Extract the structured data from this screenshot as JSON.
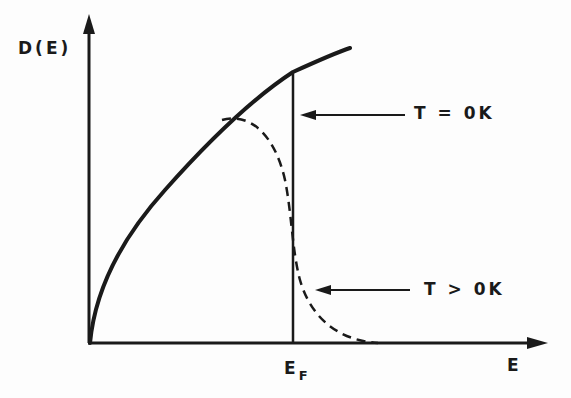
{
  "diagram": {
    "y_axis_label": "D(E)",
    "x_axis_label": "E",
    "fermi_label_main": "E",
    "fermi_label_sub": "F",
    "annotations": [
      {
        "id": "t-zero",
        "text": "T = 0K",
        "points_to": "vertical step at E_F (solid)"
      },
      {
        "id": "t-positive",
        "text": "T > 0K",
        "points_to": "dashed smeared tail"
      }
    ],
    "colors": {
      "ink": "#1a1a1a",
      "background": "#fdfdfd"
    },
    "curves": [
      {
        "name": "D(E) ~ sqrt(E)",
        "style": "solid",
        "description": "density of states rising as square root of energy"
      },
      {
        "name": "T=0K occupation",
        "style": "solid vertical",
        "description": "sharp cutoff at Fermi energy"
      },
      {
        "name": "T>0K occupation",
        "style": "dashed",
        "description": "occupied states smeared around E_F by Fermi-Dirac distribution"
      }
    ]
  }
}
